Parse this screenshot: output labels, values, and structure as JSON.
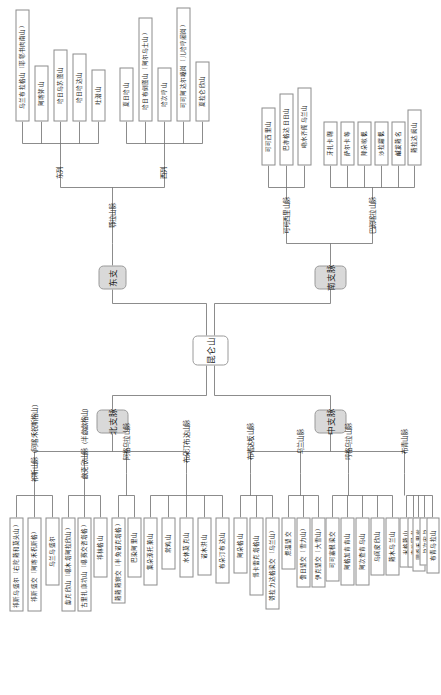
{
  "figure": {
    "type": "tree-diagram",
    "orientation": "rotated-90-ccw",
    "root": "昆仑山"
  },
  "root": {
    "label": "昆仑山"
  },
  "branches": {
    "north": {
      "label": "北支脉"
    },
    "middle": {
      "label": "中支脉"
    },
    "east": {
      "label": "东支"
    },
    "south": {
      "label": "南支脉"
    }
  },
  "north_ranges": [
    {
      "label": "祁斯山脉（阿喀禾祝斯格山）",
      "children": [
        "祁斯乌盛尔（右陀蕹和莫头山）",
        "祁斯盛交（阿喀禾祝斯格）",
        "乌兰乌盛尔"
      ]
    },
    {
      "label": "歔克欣山脉（半歔歔格山）",
      "children": [
        "歔克欣山（噶木塔阿拉欣山）",
        "古里扎康坑山（噶赛交咨塔格）",
        "祁林格山"
      ]
    },
    {
      "label": "阿格乌拉山脉",
      "children": [
        "蕹蕹蕹察交（半兔诺克塔格）",
        "巴染阿里山"
      ]
    },
    {
      "label": "布朵汀布达山脉",
      "children": [
        "集朵源托莱山",
        "常鸡山",
        "水休莫克山",
        "诺木洪山",
        "布朵汀布达山"
      ]
    }
  ],
  "middle_ranges": [
    {
      "label": "布嗜达坂山脉",
      "children": [
        "阿朵格山",
        "博卡雷克塔格山",
        "哿拉力达格梁交（乌兰山）"
      ]
    },
    {
      "label": "乌兰山脉",
      "children": [
        "煨温望交",
        "儋日望交（雪力山）",
        "伊克望交（大雪山）"
      ]
    },
    {
      "label": "哼格乌拉山脉",
      "children": [
        "可可塞根梁交",
        "阿格加肯肯山",
        "阿次查肯乌山",
        "乌阆皮欣山",
        "蕹木乌兰山"
      ]
    },
    {
      "label": "布青山脉",
      "children": [
        "米格蕹山",
        "查吃冈书",
        "圜岙禾里嗽",
        "兑次宏兑",
        "布青乌拉山"
      ]
    }
  ],
  "east_ranges": [
    {
      "label": "鄂拉山脉",
      "groups": [
        {
          "label": "东列",
          "children": [
            "乌兰布拉格山（耶鄠书肉南山）",
            "阿喀弥山",
            "哈日乌苏图山",
            "哈日哈达山",
            "吐潜山"
          ]
        },
        {
          "label": "西列",
          "children": [
            "夏日哈山",
            "哈日布倒图山（阿尔乌士山）",
            "哈次哼山",
            "可可阿达尔嗓岗（儿哈哼阇岗）",
            "夏拉仑欣山"
          ]
        }
      ]
    }
  ],
  "south_ranges": [
    {
      "label": "可可西里山脉",
      "children": [
        "可可西里山",
        "巴亦格达日日山",
        "嘞水齐阁乌兰山"
      ]
    },
    {
      "label": "巴颜喀拉山脉",
      "children": [
        "牙扎卡翺",
        "萨尔卡等",
        "降朵嗽楒",
        "沙拉糶楒",
        "鹹犮蕹名",
        "蕹拉达阙山"
      ]
    }
  ]
}
